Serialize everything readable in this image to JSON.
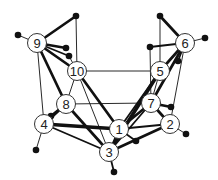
{
  "diagram": {
    "type": "graph",
    "background": "#ffffff",
    "colors": {
      "edge": "#111111",
      "node_fill": "#ffffff",
      "node_stroke": "#333333",
      "dot": "#111111"
    },
    "nodes": [
      {
        "id": "1",
        "label": "1",
        "x": 119,
        "y": 129
      },
      {
        "id": "2",
        "label": "2",
        "x": 170,
        "y": 124
      },
      {
        "id": "3",
        "label": "3",
        "x": 109,
        "y": 152
      },
      {
        "id": "4",
        "label": "4",
        "x": 44,
        "y": 124
      },
      {
        "id": "5",
        "label": "5",
        "x": 160,
        "y": 71
      },
      {
        "id": "6",
        "label": "6",
        "x": 185,
        "y": 43
      },
      {
        "id": "7",
        "label": "7",
        "x": 151,
        "y": 103
      },
      {
        "id": "8",
        "label": "8",
        "x": 66,
        "y": 104
      },
      {
        "id": "9",
        "label": "9",
        "x": 37,
        "y": 43
      },
      {
        "id": "10",
        "label": "10",
        "x": 77,
        "y": 71
      }
    ],
    "dots": [
      {
        "x": 18,
        "y": 35
      },
      {
        "x": 76,
        "y": 16
      },
      {
        "x": 66,
        "y": 48
      },
      {
        "x": 69,
        "y": 56
      },
      {
        "x": 51,
        "y": 116
      },
      {
        "x": 36,
        "y": 150
      },
      {
        "x": 160,
        "y": 16
      },
      {
        "x": 205,
        "y": 38
      },
      {
        "x": 150,
        "y": 47
      },
      {
        "x": 178,
        "y": 61
      },
      {
        "x": 171,
        "y": 107
      },
      {
        "x": 186,
        "y": 134
      },
      {
        "x": 114,
        "y": 172
      },
      {
        "x": 136,
        "y": 141
      }
    ],
    "edges": [
      {
        "x1": 37,
        "y1": 43,
        "x2": 18,
        "y2": 35,
        "w": 1
      },
      {
        "x1": 37,
        "y1": 43,
        "x2": 76,
        "y2": 16,
        "w": 3
      },
      {
        "x1": 37,
        "y1": 43,
        "x2": 66,
        "y2": 48,
        "w": 3
      },
      {
        "x1": 37,
        "y1": 43,
        "x2": 69,
        "y2": 56,
        "w": 2
      },
      {
        "x1": 37,
        "y1": 43,
        "x2": 77,
        "y2": 71,
        "w": 3
      },
      {
        "x1": 37,
        "y1": 43,
        "x2": 66,
        "y2": 104,
        "w": 3
      },
      {
        "x1": 37,
        "y1": 43,
        "x2": 44,
        "y2": 124,
        "w": 1
      },
      {
        "x1": 76,
        "y1": 16,
        "x2": 77,
        "y2": 71,
        "w": 1
      },
      {
        "x1": 69,
        "y1": 56,
        "x2": 77,
        "y2": 71,
        "w": 1
      },
      {
        "x1": 77,
        "y1": 71,
        "x2": 160,
        "y2": 71,
        "w": 1
      },
      {
        "x1": 77,
        "y1": 71,
        "x2": 66,
        "y2": 104,
        "w": 1
      },
      {
        "x1": 77,
        "y1": 71,
        "x2": 119,
        "y2": 129,
        "w": 3
      },
      {
        "x1": 77,
        "y1": 71,
        "x2": 109,
        "y2": 152,
        "w": 1
      },
      {
        "x1": 66,
        "y1": 104,
        "x2": 151,
        "y2": 103,
        "w": 1
      },
      {
        "x1": 66,
        "y1": 104,
        "x2": 51,
        "y2": 116,
        "w": 3
      },
      {
        "x1": 66,
        "y1": 104,
        "x2": 44,
        "y2": 124,
        "w": 3
      },
      {
        "x1": 66,
        "y1": 104,
        "x2": 109,
        "y2": 152,
        "w": 3
      },
      {
        "x1": 44,
        "y1": 124,
        "x2": 36,
        "y2": 150,
        "w": 1
      },
      {
        "x1": 44,
        "y1": 124,
        "x2": 119,
        "y2": 129,
        "w": 4
      },
      {
        "x1": 44,
        "y1": 124,
        "x2": 109,
        "y2": 152,
        "w": 2
      },
      {
        "x1": 185,
        "y1": 43,
        "x2": 160,
        "y2": 16,
        "w": 3
      },
      {
        "x1": 185,
        "y1": 43,
        "x2": 205,
        "y2": 38,
        "w": 1
      },
      {
        "x1": 185,
        "y1": 43,
        "x2": 150,
        "y2": 47,
        "w": 2
      },
      {
        "x1": 185,
        "y1": 43,
        "x2": 178,
        "y2": 61,
        "w": 2
      },
      {
        "x1": 185,
        "y1": 43,
        "x2": 160,
        "y2": 71,
        "w": 3
      },
      {
        "x1": 185,
        "y1": 43,
        "x2": 151,
        "y2": 103,
        "w": 3
      },
      {
        "x1": 185,
        "y1": 43,
        "x2": 170,
        "y2": 124,
        "w": 1
      },
      {
        "x1": 160,
        "y1": 16,
        "x2": 160,
        "y2": 71,
        "w": 1
      },
      {
        "x1": 150,
        "y1": 47,
        "x2": 151,
        "y2": 103,
        "w": 1
      },
      {
        "x1": 160,
        "y1": 71,
        "x2": 151,
        "y2": 103,
        "w": 1
      },
      {
        "x1": 160,
        "y1": 71,
        "x2": 109,
        "y2": 152,
        "w": 4
      },
      {
        "x1": 160,
        "y1": 71,
        "x2": 119,
        "y2": 129,
        "w": 2
      },
      {
        "x1": 151,
        "y1": 103,
        "x2": 171,
        "y2": 107,
        "w": 3
      },
      {
        "x1": 151,
        "y1": 103,
        "x2": 170,
        "y2": 124,
        "w": 3
      },
      {
        "x1": 151,
        "y1": 103,
        "x2": 119,
        "y2": 129,
        "w": 3
      },
      {
        "x1": 151,
        "y1": 103,
        "x2": 109,
        "y2": 152,
        "w": 2
      },
      {
        "x1": 170,
        "y1": 124,
        "x2": 186,
        "y2": 134,
        "w": 1
      },
      {
        "x1": 170,
        "y1": 124,
        "x2": 119,
        "y2": 129,
        "w": 2
      },
      {
        "x1": 170,
        "y1": 124,
        "x2": 109,
        "y2": 152,
        "w": 3
      },
      {
        "x1": 119,
        "y1": 129,
        "x2": 109,
        "y2": 152,
        "w": 2
      },
      {
        "x1": 119,
        "y1": 129,
        "x2": 136,
        "y2": 141,
        "w": 2
      },
      {
        "x1": 109,
        "y1": 152,
        "x2": 114,
        "y2": 172,
        "w": 2
      }
    ]
  }
}
